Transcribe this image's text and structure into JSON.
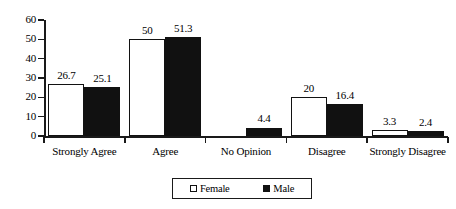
{
  "chart_data": {
    "type": "bar",
    "title": "",
    "subtitle": "",
    "xlabel": "",
    "ylabel": "",
    "categories": [
      "Strongly Agree",
      "Agree",
      "No Opinion",
      "Disagree",
      "Strongly Disagree"
    ],
    "series": [
      {
        "name": "Female",
        "color": "#ffffff",
        "border_color": "#121212",
        "values": [
          26.7,
          50,
          0,
          20,
          3.3
        ],
        "value_labels": [
          "26.7",
          "50",
          "",
          "20",
          "3.3"
        ]
      },
      {
        "name": "Male",
        "color": "#111111",
        "border_color": "#111111",
        "values": [
          25.1,
          51.3,
          4.4,
          16.4,
          2.4
        ],
        "value_labels": [
          "25.1",
          "51.3",
          "4.4",
          "16.4",
          "2.4"
        ]
      }
    ],
    "ylim": [
      0,
      60
    ],
    "ytick_labels": [
      "0",
      "10",
      "20",
      "30",
      "40",
      "50",
      "60"
    ],
    "ytick_values": [
      0,
      10,
      20,
      30,
      40,
      50,
      60
    ],
    "grid": false,
    "legend_position": "bottom",
    "legend_entries": [
      "Female",
      "Male"
    ]
  }
}
